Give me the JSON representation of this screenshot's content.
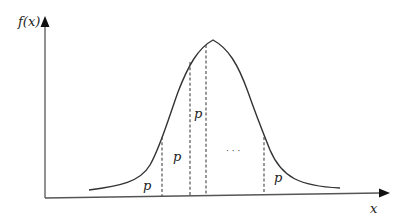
{
  "diagram": {
    "type": "normal-distribution-curve",
    "y_axis_label": "f(x)",
    "x_axis_label": "x",
    "region_labels": [
      "p",
      "p",
      "p",
      "p"
    ],
    "ellipsis": "· · ·",
    "colors": {
      "line": "#333333",
      "axis": "#555555",
      "background": "#ffffff"
    }
  }
}
